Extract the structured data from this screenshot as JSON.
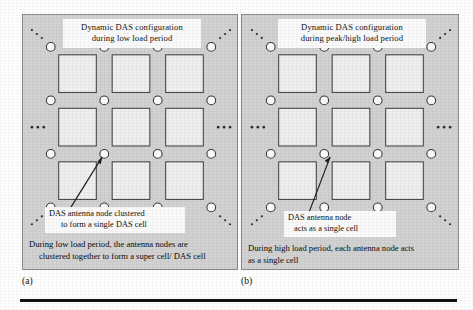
{
  "figure": {
    "bottom_rule": "horizontal-rule"
  },
  "panels": [
    {
      "id": "a",
      "label": "(a)",
      "title_line1": "Dynamic DAS configuration",
      "title_line2": "during low load period",
      "callout_line1": "DAS antenna node clustered",
      "callout_line2": "to form a single DAS cell",
      "caption_line1": "During low load period, the antenna nodes are",
      "caption_line2": "clustered together to form a super cell/ DAS cell",
      "grid": {
        "cell_rows": 3,
        "cell_cols": 3,
        "node_rows": 4,
        "node_cols": 4,
        "edge_dots": "ellipsis-continuation",
        "node_shape": "circle",
        "cell_shape": "square"
      }
    },
    {
      "id": "b",
      "label": "(b)",
      "title_line1": "Dynamic DAS configuration",
      "title_line2": "during peak/high load period",
      "callout_line1": "DAS antenna node",
      "callout_line2": "acts as a single cell",
      "caption_line1": "During high load period, each antenna node acts",
      "caption_line2": "as a single cell",
      "grid": {
        "cell_rows": 3,
        "cell_cols": 3,
        "node_rows": 4,
        "node_cols": 4,
        "edge_dots": "ellipsis-continuation",
        "node_shape": "circle",
        "cell_shape": "square"
      }
    }
  ],
  "colors": {
    "panel_background": "#d2d2d2",
    "box_background": "#fbfbfb",
    "panel_border": "#8a8a8a",
    "cell_fill": "#efefef",
    "cell_stroke": "#4a4a4a",
    "node_fill": "#fdfdfd",
    "node_stroke": "#3c3c3c",
    "rule": "#111111",
    "text": "#101010"
  }
}
